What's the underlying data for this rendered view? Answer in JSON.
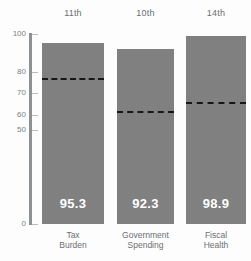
{
  "chart_data": {
    "type": "bar",
    "title": "",
    "subtitle": "",
    "xlabel": "",
    "ylabel": "",
    "ylim": [
      0,
      100
    ],
    "grid": false,
    "legend": null,
    "yticks": [
      0,
      50,
      60,
      70,
      80,
      100
    ],
    "ytick_labels": [
      "0",
      "50",
      "60",
      "70",
      "80",
      "100"
    ],
    "categories": [
      "Tax Burden",
      "Government Spending",
      "Fiscal Health"
    ],
    "category_lines": [
      [
        "Tax",
        "Burden"
      ],
      [
        "Government",
        "Spending"
      ],
      [
        "Fiscal",
        "Health"
      ]
    ],
    "values": [
      95.3,
      92.3,
      98.9
    ],
    "value_labels": [
      "95.3",
      "92.3",
      "98.9"
    ],
    "ranks": [
      "11th",
      "10th",
      "14th"
    ],
    "series": [
      {
        "name": "Score",
        "values": [
          95.3,
          92.3,
          98.9
        ]
      },
      {
        "name": "World Average",
        "values": [
          77.0,
          62.0,
          66.0
        ]
      }
    ],
    "reference_lines": [
      77.0,
      62.0,
      66.0
    ],
    "colors": {
      "bar": "#808080",
      "reference_line": "#15181a",
      "axis": "#8d9194",
      "tick_label": "#7a7f82",
      "category_label": "#6a6f73",
      "rank_label": "#6a6f73",
      "value_label": "#ffffff",
      "background": "#fdfdfd"
    }
  }
}
